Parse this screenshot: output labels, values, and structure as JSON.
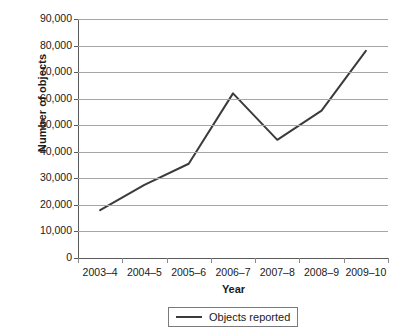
{
  "chart_data": {
    "type": "line",
    "title": "",
    "xlabel": "Year",
    "ylabel": "Number of objects",
    "categories": [
      "2003–4",
      "2004–5",
      "2005–6",
      "2006–7",
      "2007–8",
      "2008–9",
      "2009–10"
    ],
    "series": [
      {
        "name": "Objects reported",
        "values": [
          18000,
          27500,
          35500,
          62000,
          44500,
          55500,
          78000
        ],
        "color": "#3b3b3b"
      }
    ],
    "ylim": [
      0,
      90000
    ],
    "ytick_labels": [
      "90,000",
      "80,000",
      "70,000",
      "60,000",
      "50,000",
      "40,000",
      "30,000",
      "20,000",
      "10,000",
      "0"
    ],
    "ytick_values": [
      90000,
      80000,
      70000,
      60000,
      50000,
      40000,
      30000,
      20000,
      10000,
      0
    ],
    "grid": true,
    "grid_color": "#a6a6a6",
    "legend_position": "bottom",
    "legend_entries": [
      "Objects reported"
    ],
    "axis_color": "#5a5a5a",
    "background": "#ffffff"
  }
}
